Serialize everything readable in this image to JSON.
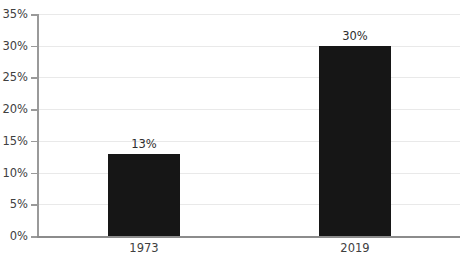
{
  "chart_data": {
    "type": "bar",
    "title": "",
    "subtitle": "",
    "xlabel": "",
    "ylabel": "",
    "categories": [
      "1973",
      "2019"
    ],
    "values": [
      13,
      30
    ],
    "value_labels": [
      "13%",
      "30%"
    ],
    "ylim": [
      0,
      35
    ],
    "ytick_values": [
      0,
      5,
      10,
      15,
      20,
      25,
      30,
      35
    ],
    "ytick_labels": [
      "0%",
      "5%",
      "10%",
      "15%",
      "20%",
      "25%",
      "30%",
      "35%"
    ],
    "grid": true,
    "grid_axis": "y",
    "legend": false,
    "legend_position": "none",
    "bar_color": "#161616",
    "grid_color": "#e9e9e9",
    "axis_color": "#9a9a9a",
    "text_color": "#404040",
    "background_color": "#ffffff"
  }
}
